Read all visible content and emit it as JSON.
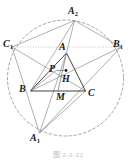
{
  "figure": {
    "caption": "图 2-2-22",
    "background_color": "#ffffff",
    "ink_color": "#1b1b1b",
    "line_color": "#8d8d8d",
    "dashed_color": "#8d8d8d",
    "dotted_color": "#a8a8a8"
  },
  "labels": [
    {
      "id": "A2",
      "base": "A",
      "sub": "2",
      "x": 68,
      "y": 6
    },
    {
      "id": "C1",
      "base": "C",
      "sub": "1",
      "x": 3,
      "y": 39
    },
    {
      "id": "B1",
      "base": "B",
      "sub": "1",
      "x": 113,
      "y": 39
    },
    {
      "id": "A",
      "base": "A",
      "sub": "",
      "x": 59,
      "y": 42
    },
    {
      "id": "P",
      "base": "P",
      "sub": "",
      "x": 49,
      "y": 64
    },
    {
      "id": "H",
      "base": "H",
      "sub": "",
      "x": 62,
      "y": 74
    },
    {
      "id": "B",
      "base": "B",
      "sub": "",
      "x": 19,
      "y": 84
    },
    {
      "id": "M",
      "base": "M",
      "sub": "",
      "x": 56,
      "y": 95
    },
    {
      "id": "C",
      "base": "C",
      "sub": "",
      "x": 88,
      "y": 90
    },
    {
      "id": "A1",
      "base": "A",
      "sub": "1",
      "x": 30,
      "y": 135
    }
  ],
  "circle": {
    "center_x": 65.5,
    "center_y": 78,
    "radius": 58,
    "style": "dashed"
  },
  "points": {
    "A": {
      "x": 66.5,
      "y": 53
    },
    "B": {
      "x": 30.5,
      "y": 91
    },
    "C": {
      "x": 85.5,
      "y": 91
    },
    "M": {
      "x": 58.0,
      "y": 91
    },
    "H": {
      "x": 66.0,
      "y": 72.5
    },
    "P": {
      "x": 56.5,
      "y": 70
    },
    "A1": {
      "x": 39.5,
      "y": 133
    },
    "A2": {
      "x": 74.5,
      "y": 20.5
    },
    "B1": {
      "x": 121.0,
      "y": 47
    },
    "C1": {
      "x": 12.0,
      "y": 47
    }
  },
  "segments": [
    {
      "name": "side-AB",
      "from": "A",
      "to": "B",
      "style": "solid"
    },
    {
      "name": "side-AC",
      "from": "A",
      "to": "C",
      "style": "solid"
    },
    {
      "name": "side-BC",
      "from": "B",
      "to": "C",
      "style": "solid"
    },
    {
      "name": "median-AM",
      "from": "A",
      "to": "M",
      "style": "solid"
    },
    {
      "name": "cevian-BH",
      "from": "B",
      "to": "H",
      "style": "solid"
    },
    {
      "name": "cevian-BP-A2",
      "from": "B",
      "to": "A2",
      "style": "solid"
    },
    {
      "name": "cevian-CP-C1",
      "from": "C",
      "to": "C1",
      "style": "solid"
    },
    {
      "name": "chord-C1-A1",
      "from": "C1",
      "to": "A1",
      "style": "solid"
    },
    {
      "name": "chord-A1-B1",
      "from": "A1",
      "to": "B1",
      "style": "solid"
    },
    {
      "name": "chord-A2-B1",
      "from": "A2",
      "to": "B1",
      "style": "solid"
    },
    {
      "name": "chord-C1-A2",
      "from": "C1",
      "to": "A2",
      "style": "solid"
    },
    {
      "name": "line-A-A1",
      "from": "A",
      "to": "A1",
      "style": "solid"
    },
    {
      "name": "line-A-A2",
      "from": "A",
      "to": "A2",
      "style": "solid"
    },
    {
      "name": "line-B-B1",
      "from": "B",
      "to": "B1",
      "style": "solid"
    },
    {
      "name": "line-C1-B1",
      "from": "C1",
      "to": "B1",
      "style": "dotted"
    },
    {
      "name": "segment-P-H",
      "from": "P",
      "to": "H",
      "style": "solid"
    },
    {
      "name": "segment-B-P",
      "from": "B",
      "to": "P",
      "style": "solid"
    }
  ],
  "markers": [
    {
      "name": "point-H-dot",
      "x": 66.0,
      "y": 70.5,
      "r": 1.4
    }
  ]
}
